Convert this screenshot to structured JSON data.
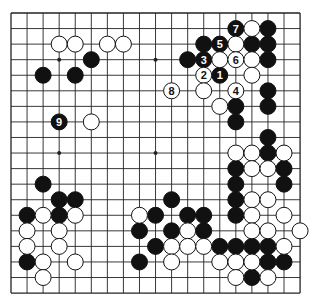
{
  "diagram": {
    "type": "go-board",
    "size": 19,
    "colors": {
      "line": "#222222",
      "black": "#111111",
      "white": "#ffffff",
      "background": "#ffffff"
    },
    "geometry": {
      "x0": 11,
      "y0": 13,
      "dx": 16.06,
      "dy": 15.56,
      "stone_radius": 8
    },
    "star_points": [
      [
        3,
        3
      ],
      [
        9,
        3
      ],
      [
        15,
        3
      ],
      [
        3,
        9
      ],
      [
        9,
        9
      ],
      [
        15,
        9
      ],
      [
        3,
        15
      ],
      [
        9,
        15
      ],
      [
        15,
        15
      ]
    ],
    "black_stones": [
      {
        "c": 5,
        "r": 3
      },
      {
        "c": 2,
        "r": 4
      },
      {
        "c": 4,
        "r": 4
      },
      {
        "c": 3,
        "r": 7,
        "label": "9"
      },
      {
        "c": 14,
        "r": 1,
        "label": "7"
      },
      {
        "c": 16,
        "r": 1
      },
      {
        "c": 12,
        "r": 2
      },
      {
        "c": 13,
        "r": 2,
        "label": "5"
      },
      {
        "c": 15,
        "r": 2
      },
      {
        "c": 16,
        "r": 2
      },
      {
        "c": 11,
        "r": 3
      },
      {
        "c": 12,
        "r": 3,
        "label": "3"
      },
      {
        "c": 16,
        "r": 3
      },
      {
        "c": 13,
        "r": 4,
        "label": "1"
      },
      {
        "c": 16,
        "r": 5
      },
      {
        "c": 14,
        "r": 6
      },
      {
        "c": 16,
        "r": 6
      },
      {
        "c": 14,
        "r": 7
      },
      {
        "c": 16,
        "r": 8
      },
      {
        "c": 16,
        "r": 9
      },
      {
        "c": 14,
        "r": 10
      },
      {
        "c": 17,
        "r": 10
      },
      {
        "c": 14,
        "r": 11
      },
      {
        "c": 17,
        "r": 11
      },
      {
        "c": 14,
        "r": 12
      },
      {
        "c": 14,
        "r": 13
      },
      {
        "c": 10,
        "r": 12
      },
      {
        "c": 9,
        "r": 13
      },
      {
        "c": 11,
        "r": 13
      },
      {
        "c": 12,
        "r": 13
      },
      {
        "c": 8,
        "r": 14
      },
      {
        "c": 10,
        "r": 14
      },
      {
        "c": 12,
        "r": 14
      },
      {
        "c": 9,
        "r": 15
      },
      {
        "c": 13,
        "r": 15
      },
      {
        "c": 14,
        "r": 15
      },
      {
        "c": 15,
        "r": 15
      },
      {
        "c": 16,
        "r": 15
      },
      {
        "c": 8,
        "r": 16
      },
      {
        "c": 16,
        "r": 16
      },
      {
        "c": 17,
        "r": 16
      },
      {
        "c": 15,
        "r": 17
      },
      {
        "c": 2,
        "r": 11
      },
      {
        "c": 3,
        "r": 12
      },
      {
        "c": 4,
        "r": 12
      },
      {
        "c": 1,
        "r": 13
      },
      {
        "c": 3,
        "r": 13
      },
      {
        "c": 1,
        "r": 16
      }
    ],
    "white_stones": [
      {
        "c": 3,
        "r": 2
      },
      {
        "c": 4,
        "r": 2
      },
      {
        "c": 6,
        "r": 2
      },
      {
        "c": 7,
        "r": 2
      },
      {
        "c": 5,
        "r": 7
      },
      {
        "c": 15,
        "r": 1
      },
      {
        "c": 14,
        "r": 2
      },
      {
        "c": 13,
        "r": 3
      },
      {
        "c": 14,
        "r": 3,
        "label": "6"
      },
      {
        "c": 15,
        "r": 3
      },
      {
        "c": 12,
        "r": 4,
        "label": "2"
      },
      {
        "c": 15,
        "r": 4
      },
      {
        "c": 10,
        "r": 5,
        "label": "8"
      },
      {
        "c": 12,
        "r": 5
      },
      {
        "c": 14,
        "r": 5,
        "label": "4"
      },
      {
        "c": 13,
        "r": 6
      },
      {
        "c": 14,
        "r": 9
      },
      {
        "c": 15,
        "r": 9
      },
      {
        "c": 17,
        "r": 9
      },
      {
        "c": 15,
        "r": 10
      },
      {
        "c": 16,
        "r": 10
      },
      {
        "c": 15,
        "r": 12
      },
      {
        "c": 16,
        "r": 12
      },
      {
        "c": 15,
        "r": 13
      },
      {
        "c": 17,
        "r": 13
      },
      {
        "c": 15,
        "r": 14
      },
      {
        "c": 16,
        "r": 14
      },
      {
        "c": 18,
        "r": 14
      },
      {
        "c": 17,
        "r": 15
      },
      {
        "c": 13,
        "r": 16
      },
      {
        "c": 14,
        "r": 16
      },
      {
        "c": 15,
        "r": 16
      },
      {
        "c": 14,
        "r": 17
      },
      {
        "c": 16,
        "r": 17
      },
      {
        "c": 8,
        "r": 13
      },
      {
        "c": 11,
        "r": 14
      },
      {
        "c": 10,
        "r": 15
      },
      {
        "c": 11,
        "r": 15
      },
      {
        "c": 12,
        "r": 15
      },
      {
        "c": 10,
        "r": 16
      },
      {
        "c": 2,
        "r": 13
      },
      {
        "c": 4,
        "r": 13
      },
      {
        "c": 1,
        "r": 14
      },
      {
        "c": 3,
        "r": 14
      },
      {
        "c": 1,
        "r": 15
      },
      {
        "c": 3,
        "r": 15
      },
      {
        "c": 2,
        "r": 16
      },
      {
        "c": 4,
        "r": 16
      },
      {
        "c": 2,
        "r": 17
      }
    ]
  }
}
